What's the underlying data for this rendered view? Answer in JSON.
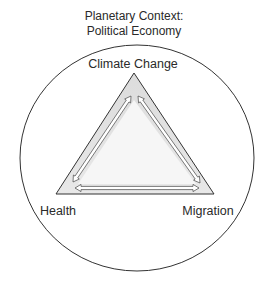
{
  "title": {
    "lines": [
      "Planetary Context:",
      "Political Economy"
    ],
    "x": 134,
    "y": [
      20,
      35
    ]
  },
  "colors": {
    "background": "#ffffff",
    "stroke": "#333333",
    "triangle_band": "#e3e3e3",
    "triangle_inner": "#f5f5f5",
    "arrow_fill": "#ffffff",
    "text": "#2a2a2a"
  },
  "circle": {
    "cx": 137,
    "cy": 158,
    "rx": 117,
    "ry": 113
  },
  "triangle": {
    "apex": [
      134,
      73
    ],
    "bottom_left": [
      56,
      194
    ],
    "bottom_right": [
      214,
      194
    ]
  },
  "nodes": [
    {
      "id": "climate-change",
      "label": "Climate Change",
      "x": 133,
      "y": 68,
      "anchor": "middle"
    },
    {
      "id": "health",
      "label": "Health",
      "x": 58,
      "y": 215,
      "anchor": "middle"
    },
    {
      "id": "migration",
      "label": "Migration",
      "x": 208,
      "y": 215,
      "anchor": "middle"
    }
  ],
  "arrows": [
    {
      "id": "health-climate",
      "from": "health",
      "to": "climate-change",
      "start": [
        73,
        182
      ],
      "end": [
        131,
        96
      ],
      "bidirectional": true
    },
    {
      "id": "climate-migration",
      "from": "climate-change",
      "to": "migration",
      "start": [
        138,
        96
      ],
      "end": [
        200,
        183
      ],
      "bidirectional": true
    },
    {
      "id": "health-migration",
      "from": "health",
      "to": "migration",
      "start": [
        75,
        188
      ],
      "end": [
        199,
        188
      ],
      "bidirectional": true
    }
  ]
}
